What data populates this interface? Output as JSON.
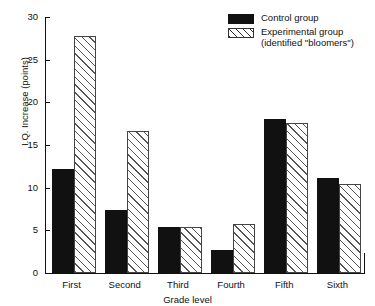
{
  "chart_data": {
    "type": "bar",
    "title": "",
    "xlabel": "Grade level",
    "ylabel": "I.Q. Increase (points)",
    "categories": [
      "First",
      "Second",
      "Third",
      "Fourth",
      "Fifth",
      "Sixth"
    ],
    "ylim": [
      0,
      30
    ],
    "yticks": [
      0,
      5,
      10,
      15,
      20,
      25,
      30
    ],
    "grid": false,
    "legend_position": "top-right",
    "series": [
      {
        "name": "Control group",
        "style": "solid-black",
        "color": "#111111",
        "values": [
          12.2,
          7.4,
          5.4,
          2.7,
          18.0,
          11.1
        ]
      },
      {
        "name": "Experimental group",
        "name_line2": "(identified \"bloomers\")",
        "style": "diagonal-hatch",
        "color": "#ffffff",
        "values": [
          27.8,
          16.6,
          5.4,
          5.8,
          17.6,
          10.4
        ]
      }
    ]
  },
  "legend": {
    "items": [
      {
        "label": "Control group",
        "sublabel": ""
      },
      {
        "label": "Experimental group",
        "sublabel": "(identified \"bloomers\")"
      }
    ]
  },
  "axes": {
    "y_title": "I.Q. Increase (points)",
    "x_title": "Grade level",
    "y_tick_labels": [
      "30",
      "25",
      "20",
      "15",
      "10",
      "5",
      "0"
    ],
    "x_tick_labels": [
      "First",
      "Second",
      "Third",
      "Fourth",
      "Fifth",
      "Sixth"
    ]
  }
}
